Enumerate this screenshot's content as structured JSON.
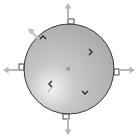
{
  "widget": {
    "type": "sphere-rotation-gizmo",
    "colors": {
      "sphere_light": "#f4f4f4",
      "sphere_mid": "#c8c8c8",
      "sphere_dark": "#a9a9a9",
      "outline": "#3a3a3a",
      "arrow": "#b8b8b8",
      "handle": "#4a4a4a",
      "chevron": "#2a2a2a",
      "center_dot": "#9a9a9a",
      "background": "#ffffff"
    },
    "handles": [
      {
        "position": "north",
        "arrow_direction": "up"
      },
      {
        "position": "east",
        "arrow_direction": "right"
      },
      {
        "position": "south",
        "arrow_direction": "down"
      },
      {
        "position": "west",
        "arrow_direction": "left"
      }
    ],
    "diagonal_arrow": {
      "direction": "up-left"
    },
    "chevrons": [
      {
        "position": "upper-left",
        "glyph": "^"
      },
      {
        "position": "upper-right",
        "glyph": ">"
      },
      {
        "position": "lower-left",
        "glyph": "<"
      },
      {
        "position": "lower-right",
        "glyph": "v"
      }
    ],
    "center": {
      "marker": "dot"
    }
  }
}
